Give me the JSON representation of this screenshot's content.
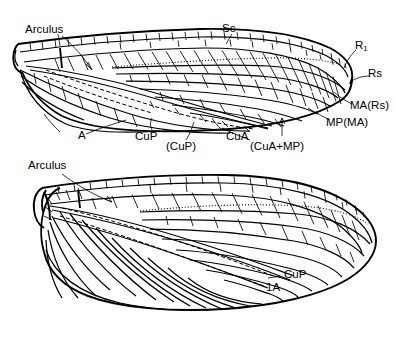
{
  "figure": {
    "background_color": "#ffffff",
    "ink_color": "#000000",
    "panels": [
      {
        "name": "forewing",
        "position": "top"
      },
      {
        "name": "hindwing",
        "position": "bottom"
      }
    ]
  },
  "labels": {
    "forewing": {
      "arculus": "Arculus",
      "sc": "Sc",
      "r1": "R",
      "r1_sub": "1",
      "rs": "Rs",
      "ma_rs": "MA(Rs)",
      "mp_ma": "MP(MA)",
      "a": "A",
      "cup": "CuP",
      "cup_paren": "(CuP)",
      "cua": "CuA",
      "cua_mp": "(CuA+MP)"
    },
    "hindwing": {
      "arculus": "Arculus",
      "cup": "CuP",
      "a1": "1A"
    }
  }
}
